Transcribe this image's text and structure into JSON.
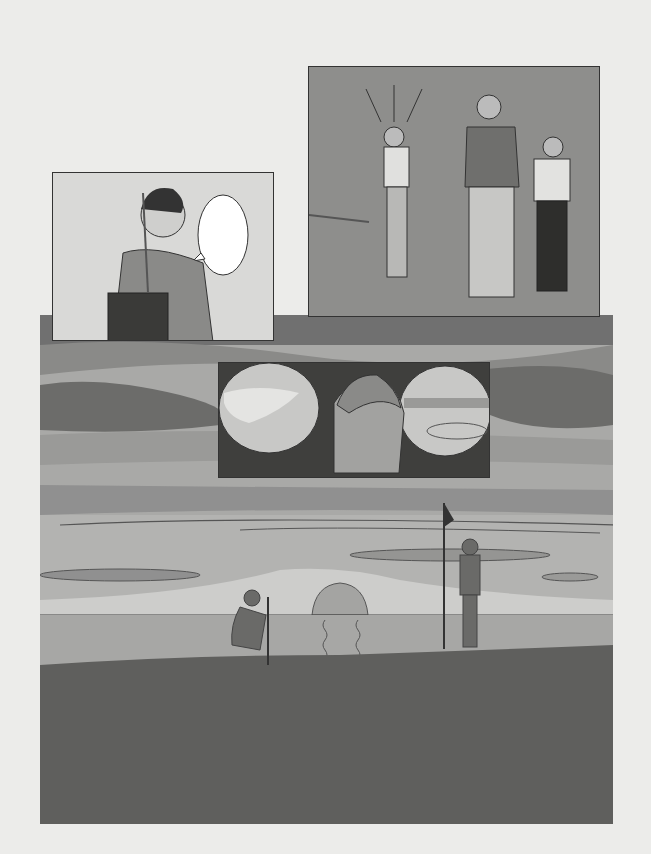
{
  "page": {
    "type": "manga page",
    "speech_bubble_text": ""
  },
  "colors": {
    "paper": "#ececea",
    "sky_light": "#b4b4b2",
    "sky_mid": "#9c9c9a",
    "cloud_dark": "#7c7c7a",
    "ground": "#5e5e5c",
    "panel_right_bg": "#8e8e8c",
    "panel_left_bg": "#d9d9d7"
  },
  "panels": [
    {
      "name": "panel-golfer-pulling-club",
      "description": "Young man pulling a club from golf bag, empty speech bubble"
    },
    {
      "name": "panel-three-men",
      "description": "Golfer swinging while two men watch, arms crossed"
    },
    {
      "name": "panel-closeup-face",
      "description": "Close-up determined face with vignettes of green and ball landing in water"
    },
    {
      "name": "panel-sunset-course",
      "description": "Sunset over golf course, crouching player reading green, caddie holding flagstick"
    }
  ]
}
